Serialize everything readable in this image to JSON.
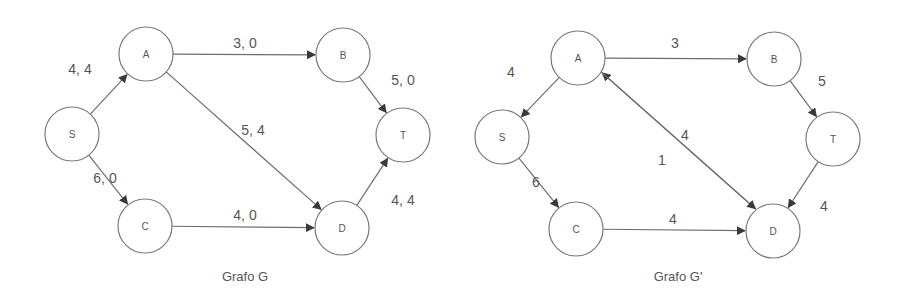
{
  "colors": {
    "background": "#ffffff",
    "stroke": "#7a7a7a",
    "edge": "#6e6e6e",
    "arrowhead": "#3a3a3a",
    "text": "#555555"
  },
  "graphs": [
    {
      "id": "G",
      "caption": "Grafo G",
      "caption_pos": [
        245,
        276
      ],
      "nodes": [
        {
          "id": "S",
          "label": "S",
          "x": 72,
          "y": 134
        },
        {
          "id": "A",
          "label": "A",
          "x": 146,
          "y": 54
        },
        {
          "id": "B",
          "label": "B",
          "x": 343,
          "y": 55
        },
        {
          "id": "T",
          "label": "T",
          "x": 403,
          "y": 135
        },
        {
          "id": "C",
          "label": "C",
          "x": 145,
          "y": 226
        },
        {
          "id": "D",
          "label": "D",
          "x": 342,
          "y": 228
        }
      ],
      "edges": [
        {
          "from": "S",
          "to": "A",
          "label": "4, 4",
          "lx": 80,
          "ly": 69
        },
        {
          "from": "A",
          "to": "B",
          "label": "3, 0",
          "lx": 245,
          "ly": 43
        },
        {
          "from": "B",
          "to": "T",
          "label": "5, 0",
          "lx": 403,
          "ly": 80
        },
        {
          "from": "A",
          "to": "D",
          "label": "5, 4",
          "lx": 253,
          "ly": 130
        },
        {
          "from": "S",
          "to": "C",
          "label": "6, 0",
          "lx": 105,
          "ly": 178
        },
        {
          "from": "C",
          "to": "D",
          "label": "4, 0",
          "lx": 245,
          "ly": 215
        },
        {
          "from": "D",
          "to": "T",
          "label": "4, 4",
          "lx": 403,
          "ly": 200
        }
      ]
    },
    {
      "id": "G_prime",
      "caption": "Grafo G'",
      "caption_pos": [
        678,
        276
      ],
      "nodes": [
        {
          "id": "A",
          "label": "A",
          "x": 578,
          "y": 58
        },
        {
          "id": "B",
          "label": "B",
          "x": 774,
          "y": 59
        },
        {
          "id": "S",
          "label": "S",
          "x": 502,
          "y": 137
        },
        {
          "id": "T",
          "label": "T",
          "x": 833,
          "y": 139
        },
        {
          "id": "C",
          "label": "C",
          "x": 576,
          "y": 229
        },
        {
          "id": "D",
          "label": "D",
          "x": 773,
          "y": 231
        }
      ],
      "edges": [
        {
          "from": "A",
          "to": "B",
          "label": "3",
          "lx": 675,
          "ly": 43
        },
        {
          "from": "A",
          "to": "S",
          "label": "4",
          "lx": 511,
          "ly": 72
        },
        {
          "from": "B",
          "to": "T",
          "label": "5",
          "lx": 822,
          "ly": 81
        },
        {
          "from": "D",
          "to": "A",
          "label": "4",
          "lx": 685,
          "ly": 135,
          "offset": 5
        },
        {
          "from": "A",
          "to": "D",
          "label": "1",
          "lx": 662,
          "ly": 160,
          "offset": -5
        },
        {
          "from": "S",
          "to": "C",
          "label": "6",
          "lx": 536,
          "ly": 182
        },
        {
          "from": "C",
          "to": "D",
          "label": "4",
          "lx": 673,
          "ly": 219
        },
        {
          "from": "T",
          "to": "D",
          "label": "4",
          "lx": 824,
          "ly": 206
        }
      ]
    }
  ],
  "node_radius": 27
}
